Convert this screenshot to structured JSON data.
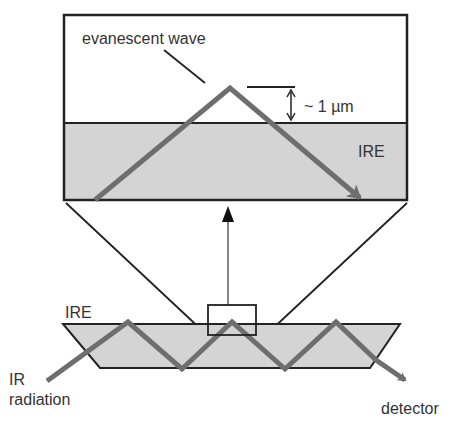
{
  "labels": {
    "evanescent_wave": "evanescent wave",
    "depth": "~ 1 µm",
    "ire_top": "IRE",
    "ire_bottom": "IRE",
    "ir_line1": "IR",
    "ir_line2": "radiation",
    "detector": "detector"
  },
  "colors": {
    "crystal_fill": "#d4d4d4",
    "beam": "#6e6e6e",
    "outline": "#222222",
    "text": "#333333",
    "background": "#ffffff"
  },
  "icons": {
    "beam_arrow": "arrow-head",
    "magnify_arrow": "arrow-up",
    "depth_marker": "double-arrow-vertical"
  }
}
